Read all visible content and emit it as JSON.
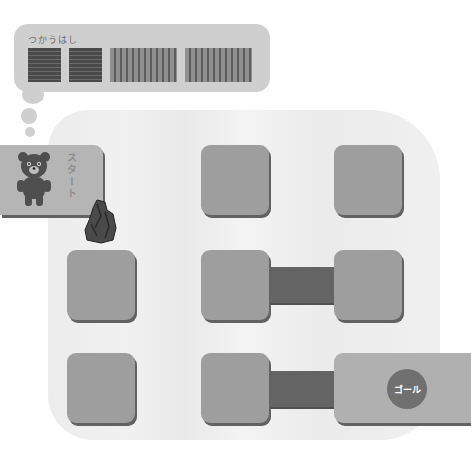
{
  "bubble": {
    "label": "つかうはし",
    "bridges": [
      {
        "type": "short",
        "pattern": "horizontal-stripes"
      },
      {
        "type": "short",
        "pattern": "horizontal-stripes"
      },
      {
        "type": "long",
        "pattern": "vertical-stripes"
      },
      {
        "type": "long",
        "pattern": "vertical-stripes"
      }
    ]
  },
  "board": {
    "start_label": "スタート",
    "goal_label": "ゴール",
    "grid": {
      "rows": 3,
      "cols": 3
    },
    "placed_bridges": [
      {
        "row": 2,
        "from_col": 2,
        "to_col": 3
      },
      {
        "row": 3,
        "from_col": 2,
        "to_col": 3
      }
    ],
    "obstacle": "rock"
  },
  "colors": {
    "tile": "#9e9e9e",
    "bridge": "#646464",
    "board": "#ececec",
    "bubble": "#cfcfcf"
  }
}
